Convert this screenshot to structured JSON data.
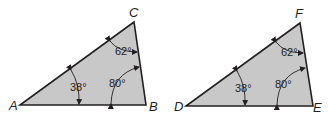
{
  "colors": {
    "fill": "#c8c8c8",
    "stroke": "#231f20",
    "background": "#ffffff"
  },
  "triangles": [
    {
      "name": "ABC",
      "vertices": {
        "v1": "A",
        "v2": "B",
        "v3": "C"
      },
      "angles": {
        "at_v1": "38°",
        "at_v2": "80°",
        "at_v3": "62°"
      }
    },
    {
      "name": "DEF",
      "vertices": {
        "v1": "D",
        "v2": "E",
        "v3": "F"
      },
      "angles": {
        "at_v1": "38°",
        "at_v2": "80°",
        "at_v3": "62°"
      }
    }
  ]
}
